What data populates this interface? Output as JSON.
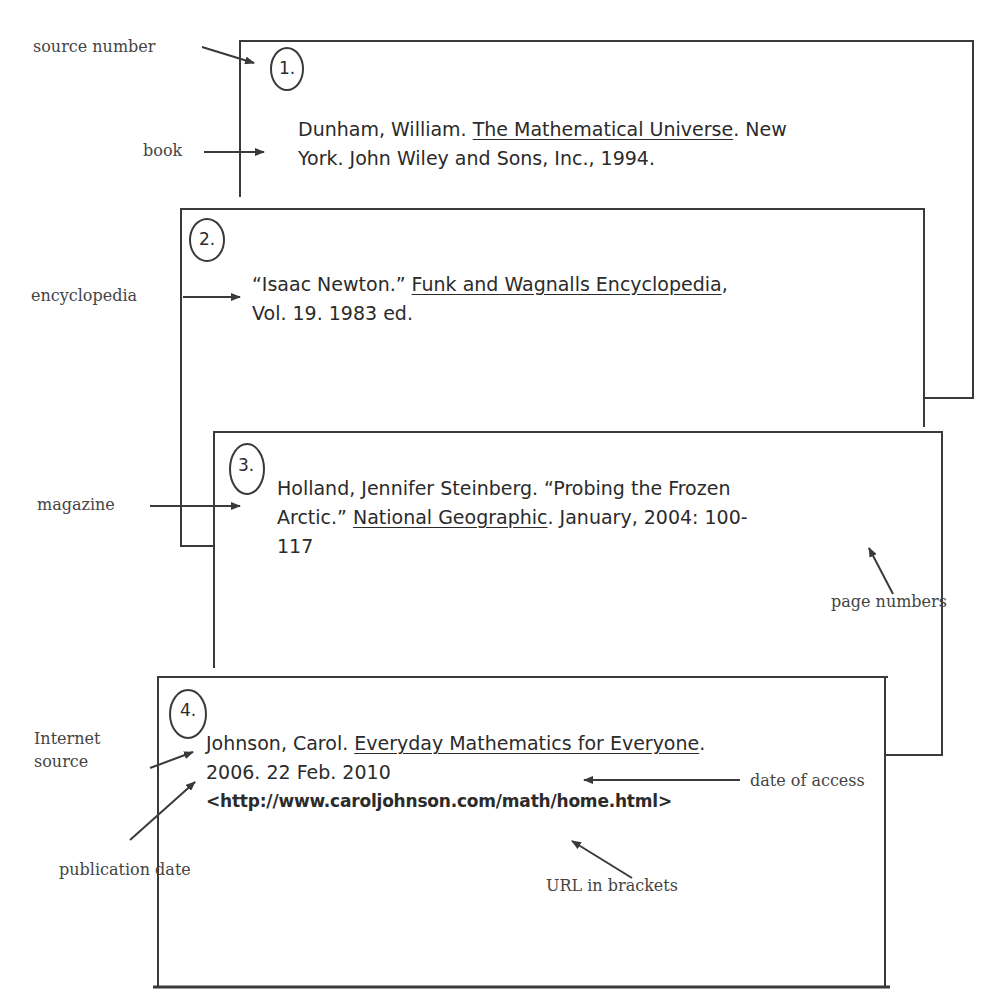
{
  "labels": {
    "source_number": "source number",
    "book": "book",
    "encyclopedia": "encyclopedia",
    "magazine": "magazine",
    "internet_source_line1": "Internet",
    "internet_source_line2": "source",
    "page_numbers": "page numbers",
    "date_of_access": "date of access",
    "publication_date": "publication date",
    "url_in_brackets": "URL in brackets"
  },
  "entries": [
    {
      "number": "1.",
      "type": "book",
      "line1_before": "Dunham, William. ",
      "line1_title": "The Mathematical Universe",
      "line1_after": ". New",
      "line2": "York. John Wiley and Sons, Inc., 1994."
    },
    {
      "number": "2.",
      "type": "encyclopedia",
      "line1_before": "“Isaac Newton.” ",
      "line1_title": "Funk and Wagnalls Encyclopedia",
      "line1_after": ",",
      "line2": "Vol. 19. 1983 ed."
    },
    {
      "number": "3.",
      "type": "magazine",
      "line1": "Holland, Jennifer Steinberg. “Probing the Frozen",
      "line2_before": "Arctic.” ",
      "line2_title": "National Geographic",
      "line2_after": ". January, 2004: 100-",
      "line3": "117"
    },
    {
      "number": "4.",
      "type": "internet",
      "line1_before": "Johnson, Carol. ",
      "line1_title": "Everyday Mathematics for Everyone",
      "line1_after": ".",
      "line2": "2006. 22 Feb. 2010",
      "line3": "<http://www.caroljohnson.com/math/home.html>"
    }
  ],
  "colors": {
    "line": "#3a3a3a",
    "text": "#2b2b2b",
    "label": "#444444",
    "background": "#ffffff"
  }
}
